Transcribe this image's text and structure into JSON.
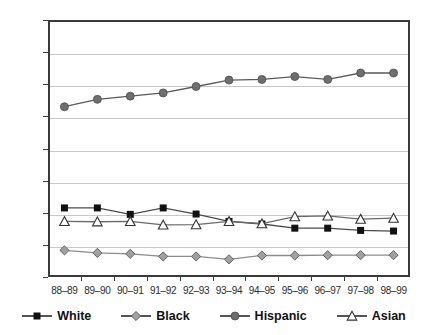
{
  "chart_data": {
    "type": "line",
    "title": "",
    "subtitle": "",
    "xlabel": "",
    "ylabel": "",
    "categories": [
      "88–89",
      "89–90",
      "90–91",
      "91–92",
      "92–93",
      "93–94",
      "94–95",
      "95–96",
      "96–97",
      "97–98",
      "98–99"
    ],
    "ylim": [
      0,
      80
    ],
    "ytick_labels": [
      "0%",
      "10%",
      "20%",
      "30%",
      "40%",
      "50%",
      "60%",
      "70%",
      "80%"
    ],
    "ytick_values": [
      0,
      10,
      20,
      30,
      40,
      50,
      60,
      70,
      80
    ],
    "grid": true,
    "legend_position": "bottom",
    "series": [
      {
        "name": "White",
        "marker": "filled-square",
        "color": "#111111",
        "line_color": "#4a4a4a",
        "values": [
          21.5,
          21.5,
          19.5,
          21.5,
          19.6,
          17.3,
          16.5,
          15.2,
          15.2,
          14.5,
          14.3
        ]
      },
      {
        "name": "Black",
        "marker": "gray-diamond",
        "color": "#9b9b9b",
        "line_color": "#8c8c8c",
        "values": [
          8.3,
          7.5,
          7.2,
          6.4,
          6.4,
          5.5,
          6.7,
          6.7,
          6.8,
          6.8,
          6.8
        ]
      },
      {
        "name": "Hispanic",
        "marker": "gray-circle",
        "color": "#6e6e6e",
        "line_color": "#5a5a5a",
        "values": [
          53.0,
          55.3,
          56.3,
          57.3,
          59.3,
          61.3,
          61.5,
          62.4,
          61.5,
          63.5,
          63.5
        ]
      },
      {
        "name": "Asian",
        "marker": "open-triangle",
        "color": "#ffffff",
        "line_color": "#6a6a6a",
        "values": [
          17.3,
          17.2,
          17.3,
          16.2,
          16.3,
          17.3,
          16.6,
          18.8,
          19.0,
          18.0,
          18.3
        ]
      }
    ]
  },
  "legend": {
    "items": [
      {
        "label": "White",
        "marker": "filled-square"
      },
      {
        "label": "Black",
        "marker": "gray-diamond"
      },
      {
        "label": "Hispanic",
        "marker": "gray-circle"
      },
      {
        "label": "Asian",
        "marker": "open-triangle"
      }
    ]
  },
  "axes": {
    "y_axis_name": "percent-axis",
    "x_axis_name": "school-year-axis"
  }
}
